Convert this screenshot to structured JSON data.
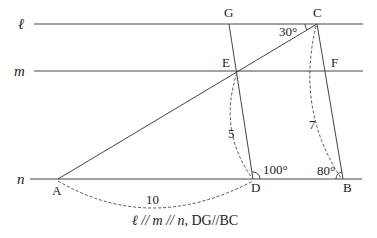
{
  "diagram": {
    "lines": [
      {
        "name": "l",
        "label": "ℓ",
        "y": 24,
        "x1": 34,
        "x2": 363
      },
      {
        "name": "m",
        "label": "m",
        "y": 71,
        "x1": 34,
        "x2": 363
      },
      {
        "name": "n",
        "label": "n",
        "y": 179,
        "x1": 30,
        "x2": 362
      }
    ],
    "points": {
      "A": {
        "label": "A",
        "x": 58,
        "y": 179
      },
      "B": {
        "label": "B",
        "x": 343,
        "y": 179
      },
      "C": {
        "label": "C",
        "x": 317,
        "y": 24
      },
      "D": {
        "label": "D",
        "x": 253,
        "y": 179
      },
      "E": {
        "label": "E",
        "x": 237,
        "y": 71
      },
      "F": {
        "label": "F",
        "x": 327,
        "y": 71
      },
      "G": {
        "label": "G",
        "x": 229,
        "y": 24
      }
    },
    "angles": {
      "C": "30°",
      "D": "100°",
      "B": "80°"
    },
    "lengths": {
      "AD": "10",
      "ED": "5",
      "CB": "7"
    },
    "caption": {
      "parallel_lines": "ℓ // m // n,",
      "parallel_segments": "DG//BC"
    },
    "colors": {
      "stroke": "#333333",
      "background": "#ffffff"
    }
  }
}
